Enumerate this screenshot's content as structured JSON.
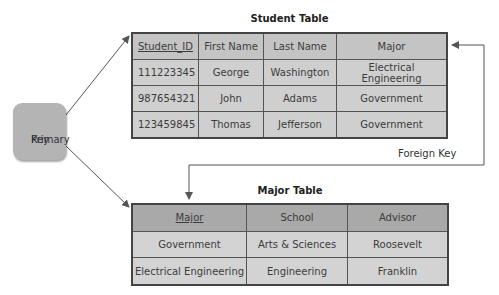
{
  "student_table": {
    "title": "Student Table",
    "columns": [
      "Student_ID",
      "First Name",
      "Last Name",
      "Major"
    ],
    "primary_key_column": "Student_ID",
    "rows": [
      [
        "111223345",
        "George",
        "Washington",
        "Electrical Engineering"
      ],
      [
        "987654321",
        "John",
        "Adams",
        "Government"
      ],
      [
        "123459845",
        "Thomas",
        "Jefferson",
        "Government"
      ]
    ]
  },
  "major_table": {
    "title": "Major Table",
    "columns": [
      "Major",
      "School",
      "Advisor"
    ],
    "primary_key_column": "Major",
    "rows": [
      [
        "Government",
        "Arts & Sciences",
        "Roosevelt"
      ],
      [
        "Electrical Engineering",
        "Engineering",
        "Franklin"
      ]
    ]
  },
  "primary_key_box": {
    "label_line1": "Primary",
    "label_line2": "Key"
  },
  "foreign_key": {
    "label": "Foreign Key"
  },
  "colors": {
    "student_header": "#c4c4c4",
    "student_body": "#cfcfcf",
    "major_header": "#a9a9a9",
    "major_body": "#d3d3d3",
    "primary_key_box": "#b4b4b4",
    "lines": "#555555"
  }
}
